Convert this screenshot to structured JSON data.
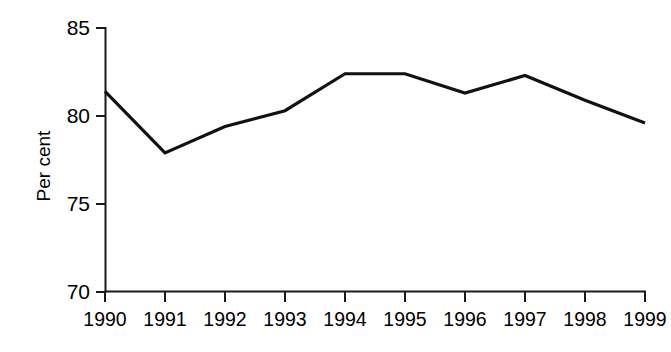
{
  "chart_data": {
    "type": "line",
    "title": "",
    "subtitle": "",
    "xlabel": "",
    "ylabel": "Per cent",
    "categories": [
      "1990",
      "1991",
      "1992",
      "1993",
      "1994",
      "1995",
      "1996",
      "1997",
      "1998",
      "1999"
    ],
    "x": [
      1990,
      1991,
      1992,
      1993,
      1994,
      1995,
      1996,
      1997,
      1998,
      1999
    ],
    "values": [
      81.4,
      77.9,
      79.4,
      80.3,
      82.4,
      82.4,
      81.3,
      82.3,
      80.9,
      79.6
    ],
    "series": [
      {
        "name": "Per cent",
        "values": [
          81.4,
          77.9,
          79.4,
          80.3,
          82.4,
          82.4,
          81.3,
          82.3,
          80.9,
          79.6
        ],
        "color": "#111111"
      }
    ],
    "ylim": [
      70,
      85
    ],
    "yticks": [
      70,
      75,
      80,
      85
    ],
    "ytick_labels": [
      "70",
      "75",
      "80",
      "85"
    ],
    "xlim": [
      1990,
      1999
    ],
    "grid": false,
    "legend": false,
    "legend_position": "none",
    "annotations": []
  },
  "axes": {
    "y_axis_title": "Per cent",
    "x_axis_title": ""
  },
  "colors": {
    "line": "#111111",
    "axis": "#1a1a1a",
    "background": "#ffffff",
    "text": "#000000"
  }
}
